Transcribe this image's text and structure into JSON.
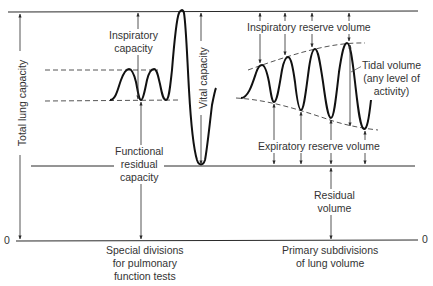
{
  "diagram": {
    "axis": {
      "zero_left": "0",
      "zero_right": "0"
    },
    "left_section": {
      "total_lung_capacity": "Total lung capacity",
      "inspiratory_capacity": [
        "Inspiratory",
        "capacity"
      ],
      "vital_capacity": "Vital capacity",
      "functional_residual_capacity": [
        "Functional",
        "residual",
        "capacity"
      ],
      "caption": [
        "Special divisions",
        "for pulmonary",
        "function tests"
      ]
    },
    "right_section": {
      "inspiratory_reserve_volume": "Inspiratory reserve volume",
      "tidal_volume": [
        "Tidal volume",
        "(any level of",
        "activity)"
      ],
      "expiratory_reserve_volume": "Expiratory reserve volume",
      "residual_volume": [
        "Residual",
        "volume"
      ],
      "caption": [
        "Primary subdivisions",
        "of lung volume"
      ]
    },
    "colors": {
      "line": "#2a2a2a",
      "text": "#333333",
      "background": "#ffffff"
    }
  }
}
